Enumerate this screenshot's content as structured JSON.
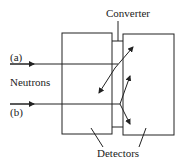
{
  "diagram": {
    "labels": {
      "converter": "Converter",
      "beam_a": "(a)",
      "neutrons": "Neutrons",
      "beam_b": "(b)",
      "detectors": "Detectors"
    },
    "components": [
      "left detector",
      "converter",
      "right detector"
    ],
    "colors": {
      "line": "#222222",
      "background": "#ffffff"
    }
  }
}
